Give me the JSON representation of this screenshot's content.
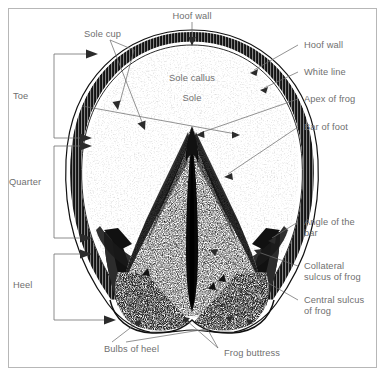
{
  "figure": {
    "border_color": "#b7b7b7",
    "text_color": "#6f6f6f",
    "ink_color": "#111111",
    "background": "#ffffff"
  },
  "labels": {
    "hoof_wall_top": "Hoof wall",
    "sole_cup": "Sole cup",
    "toe": "Toe",
    "quarter": "Quarter",
    "heel": "Heel",
    "sole_callus": "Sole callus",
    "sole": "Sole",
    "hoof_wall_right": "Hoof wall",
    "white_line": "White line",
    "apex_of_frog": "Apex of frog",
    "bar_of_foot": "Bar of foot",
    "angle_of_the_bar_line1": "Angle of the",
    "angle_of_the_bar_line2": "bar",
    "collateral_sulcus_line1": "Collateral",
    "collateral_sulcus_line2": "sulcus of frog",
    "central_sulcus_line1": "Central sulcus",
    "central_sulcus_line2": "of frog",
    "bulbs_of_heel": "Bulbs of heel",
    "frog_buttress": "Frog buttress"
  },
  "callouts": [
    {
      "name": "hoof-wall-top",
      "text": "Hoof wall",
      "position": "top-center",
      "pointer": "down-arrow"
    },
    {
      "name": "sole-cup",
      "text": "Sole cup",
      "position": "top-left",
      "pointer": "two-branch-arrows"
    },
    {
      "name": "hoof-wall-right",
      "text": "Hoof wall",
      "position": "right-upper",
      "pointer": "leader-arrow"
    },
    {
      "name": "white-line",
      "text": "White line",
      "position": "right-upper",
      "pointer": "leader-arrow"
    },
    {
      "name": "apex-of-frog",
      "text": "Apex of frog",
      "position": "right-upper",
      "pointer": "leader-arrow"
    },
    {
      "name": "bar-of-foot",
      "text": "Bar of foot",
      "position": "right-upper",
      "pointer": "leader-arrow"
    },
    {
      "name": "angle-of-the-bar",
      "text": "Angle of the bar",
      "position": "right-lower",
      "pointer": "leader-arrow"
    },
    {
      "name": "collateral-sulcus-of-frog",
      "text": "Collateral sulcus of frog",
      "position": "right-lower",
      "pointer": "leader-line"
    },
    {
      "name": "central-sulcus-of-frog",
      "text": "Central sulcus of frog",
      "position": "right-lower",
      "pointer": "leader-line"
    },
    {
      "name": "bulbs-of-heel",
      "text": "Bulbs of heel",
      "position": "bottom-left",
      "pointer": "two-branch-arrows"
    },
    {
      "name": "frog-buttress",
      "text": "Frog buttress",
      "position": "bottom-right",
      "pointer": "two-branch-arrows"
    },
    {
      "name": "sole-callus",
      "text": "Sole callus",
      "position": "interior-upper",
      "pointer": "none"
    },
    {
      "name": "sole",
      "text": "Sole",
      "position": "interior-upper",
      "pointer": "none"
    }
  ],
  "brackets": [
    {
      "name": "toe",
      "label": "Toe",
      "arrows": 2
    },
    {
      "name": "quarter",
      "label": "Quarter",
      "arrows": 2
    },
    {
      "name": "heel",
      "label": "Heel",
      "arrows": 2
    }
  ]
}
